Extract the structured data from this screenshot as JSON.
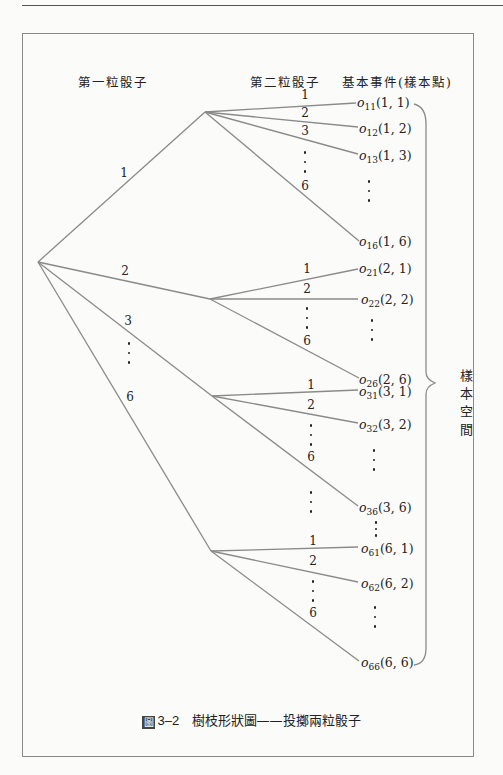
{
  "headers": {
    "first_die": "第一粒骰子",
    "second_die": "第二粒骰子",
    "basic_events": "基本事件(樣本點)"
  },
  "first_branch_labels": [
    "1",
    "2",
    "3",
    "6"
  ],
  "second_branch_labels": {
    "group1": [
      "1",
      "2",
      "3",
      "6"
    ],
    "group2": [
      "1",
      "2",
      "6"
    ],
    "group3": [
      "1",
      "2",
      "6"
    ],
    "group6": [
      "1",
      "2",
      "6"
    ]
  },
  "outcomes": {
    "o11": {
      "sym": "o",
      "sub": "11",
      "pair": "(1, 1)"
    },
    "o12": {
      "sym": "o",
      "sub": "12",
      "pair": "(1, 2)"
    },
    "o13": {
      "sym": "o",
      "sub": "13",
      "pair": "(1, 3)"
    },
    "o16": {
      "sym": "o",
      "sub": "16",
      "pair": "(1, 6)"
    },
    "o21": {
      "sym": "o",
      "sub": "21",
      "pair": "(2, 1)"
    },
    "o22": {
      "sym": "o",
      "sub": "22",
      "pair": "(2, 2)"
    },
    "o26": {
      "sym": "o",
      "sub": "26",
      "pair": "(2, 6)"
    },
    "o31": {
      "sym": "o",
      "sub": "31",
      "pair": "(3, 1)"
    },
    "o32": {
      "sym": "o",
      "sub": "32",
      "pair": "(3, 2)"
    },
    "o36": {
      "sym": "o",
      "sub": "36",
      "pair": "(3, 6)"
    },
    "o61": {
      "sym": "o",
      "sub": "61",
      "pair": "(6, 1)"
    },
    "o62": {
      "sym": "o",
      "sub": "62",
      "pair": "(6, 2)"
    },
    "o66": {
      "sym": "o",
      "sub": "66",
      "pair": "(6, 6)"
    }
  },
  "sample_space_label": [
    "樣",
    "本",
    "空",
    "間"
  ],
  "caption": {
    "icon": "圖",
    "number": "3–2",
    "title": "樹枝形狀圖——投擲兩粒骰子"
  },
  "colors": {
    "line": "#8a8a8a",
    "text": "#222222",
    "background": "#fbfbfa"
  }
}
